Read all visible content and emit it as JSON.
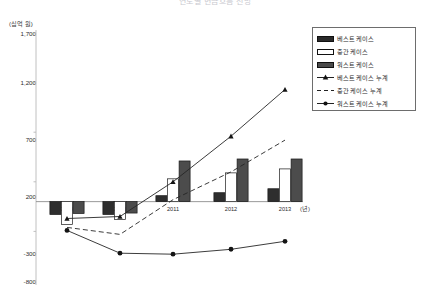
{
  "title": "연도별 현금흐름 전망",
  "axes": {
    "y_unit_label": "(십억 원)",
    "x_unit_label": "(년)",
    "y_ticks": [
      "1,700",
      "1,200",
      "700",
      "200",
      "-300",
      "-800"
    ],
    "x_ticks": [
      "2009",
      "2010",
      "2011",
      "2012",
      "2013"
    ]
  },
  "legend": {
    "items": [
      {
        "label": "베스트 케이스",
        "marker": "bar-dark"
      },
      {
        "label": "중간 케이스",
        "marker": "bar-white"
      },
      {
        "label": "워스트 케이스",
        "marker": "bar-gray"
      },
      {
        "label": "베스트 케이스 누계",
        "marker": "line-triangle"
      },
      {
        "label": "중간 케이스 누계",
        "marker": "line-dashed"
      },
      {
        "label": "워스트 케이스 누계",
        "marker": "line-circle"
      }
    ]
  },
  "chart_data": {
    "type": "bar",
    "title": "연도별 현금흐름 전망",
    "xlabel": "(년)",
    "ylabel": "(십억 원)",
    "ylim": [
      -800,
      1700
    ],
    "categories": [
      "2009",
      "2010",
      "2011",
      "2012",
      "2013"
    ],
    "grid": false,
    "legend_position": "top-right",
    "series": [
      {
        "name": "베스트 케이스",
        "type": "bar",
        "values": [
          -130,
          -130,
          60,
          90,
          130
        ]
      },
      {
        "name": "중간 케이스",
        "type": "bar",
        "values": [
          -230,
          -180,
          230,
          290,
          330
        ]
      },
      {
        "name": "워스트 케이스",
        "type": "bar",
        "values": [
          -120,
          -115,
          410,
          430,
          430
        ]
      },
      {
        "name": "베스트 케이스 누계",
        "type": "line",
        "marker": "triangle",
        "values": [
          -170,
          -150,
          200,
          660,
          1130
        ]
      },
      {
        "name": "중간 케이스 누계",
        "type": "line",
        "marker": "dashed",
        "values": [
          -260,
          -330,
          20,
          300,
          620
        ]
      },
      {
        "name": "워스트 케이스 누계",
        "type": "line",
        "marker": "circle",
        "values": [
          -290,
          -520,
          -530,
          -480,
          -400
        ]
      }
    ]
  }
}
